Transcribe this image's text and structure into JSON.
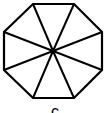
{
  "diagram": {
    "shape": "regular-octagon",
    "segments": 8,
    "stroke_color": "#000000",
    "fill_color": "#ffffff",
    "center": [
      53,
      51
    ],
    "vertices": [
      [
        33,
        4
      ],
      [
        74,
        4
      ],
      [
        102,
        32
      ],
      [
        102,
        70
      ],
      [
        74,
        98
      ],
      [
        33,
        98
      ],
      [
        4,
        70
      ],
      [
        4,
        32
      ]
    ],
    "label": "c"
  }
}
